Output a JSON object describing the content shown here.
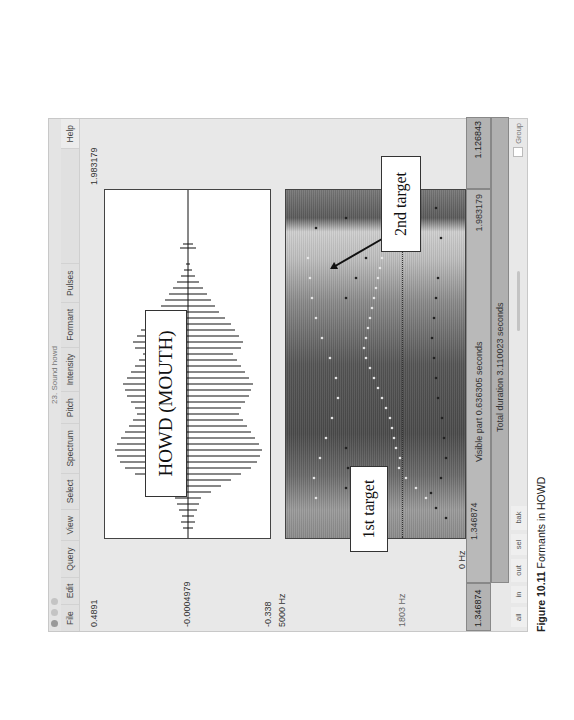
{
  "window": {
    "title": "23. Sound howd",
    "menus": [
      "File",
      "Edit",
      "Query",
      "View",
      "Select",
      "Spectrum",
      "Pitch",
      "Intensity",
      "Formant",
      "Pulses"
    ],
    "help": "Help"
  },
  "waveform": {
    "top_value": "0.4891",
    "mid_value": "-0.0004979",
    "bottom_value": "-0.338",
    "end_time": "1.983179"
  },
  "spectrogram": {
    "top_freq": "5000 Hz",
    "cursor_freq": "1803 Hz",
    "bottom_freq": "0 Hz"
  },
  "annotations": {
    "title": "HOWD (MOUTH)",
    "first_target": "1st target",
    "second_target": "2nd target"
  },
  "time_bars": {
    "left_start": "1.346874",
    "visible_start": "1.346874",
    "visible_label": "Visible part 0.636305 seconds",
    "visible_end": "1.983179",
    "right_value": "1.126843",
    "total_label": "Total duration 3.110023 seconds"
  },
  "buttons": [
    "all",
    "in",
    "out",
    "sel",
    "bak"
  ],
  "group_label": "Group",
  "caption": {
    "figure": "Figure 10.11",
    "text": " Formants in HOWD"
  }
}
